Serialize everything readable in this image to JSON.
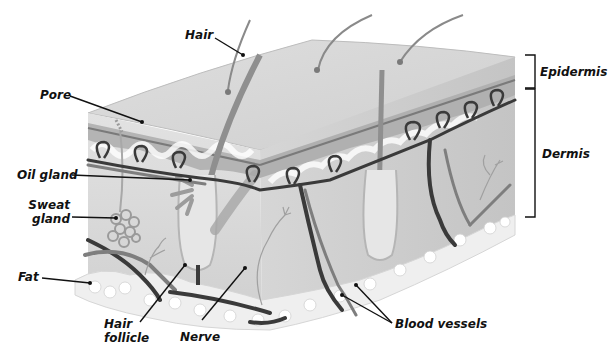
{
  "diagram": {
    "labels": {
      "hair": "Hair",
      "pore": "Pore",
      "oil_gland": "Oil gland",
      "sweat_gland_line1": "Sweat",
      "sweat_gland_line2": "gland",
      "fat": "Fat",
      "hair_follicle_line1": "Hair",
      "hair_follicle_line2": "follicle",
      "nerve": "Nerve",
      "blood_vessels": "Blood vessels",
      "epidermis": "Epidermis",
      "dermis": "Dermis"
    },
    "layers": [
      "Epidermis",
      "Dermis",
      "Fat"
    ],
    "colors": {
      "skin_top": "#d6d6d6",
      "skin_side": "#c8c8c8",
      "epidermis_band": "#a9a9a9",
      "dermis": "#dcdcdc",
      "fat": "#f0f0f0",
      "vessel_dark": "#3a3a3a",
      "vessel_light": "#8a8a8a",
      "leader_line": "#111111"
    }
  }
}
